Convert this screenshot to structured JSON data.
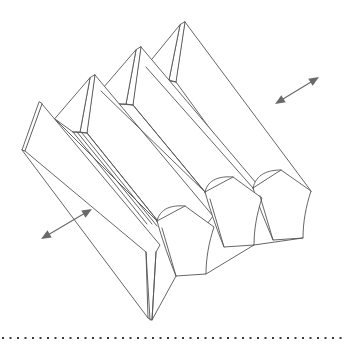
{
  "figure": {
    "background_color": "#ffffff",
    "line_color": "#555555",
    "arrow_color": "#6a6a6a",
    "rule_color": "#3a3a3a",
    "width": 347,
    "height": 357,
    "caption": ""
  },
  "annotations": {
    "arrow_upper_right": {
      "name": "expansion-direction-arrow-upper-right",
      "type": "double-headed-arrow",
      "start": [
        275,
        104
      ],
      "end": [
        319,
        77
      ],
      "label": ""
    },
    "arrow_lower_left": {
      "name": "expansion-direction-arrow-lower-left",
      "type": "double-headed-arrow",
      "start": [
        41,
        239
      ],
      "end": [
        92,
        209
      ],
      "label": ""
    }
  },
  "separator": {
    "name": "dotted-rule",
    "y": 338,
    "x_start": 2,
    "x_end": 345,
    "style": "dotted"
  },
  "geometry": {
    "ridge_count": 4,
    "ridge_apexes": [
      [
        185,
        22
      ],
      [
        141,
        47
      ],
      [
        95,
        75
      ],
      [
        42,
        104
      ]
    ],
    "end_flap_count": 3,
    "description": "Four parallel diagonal ridges forming a corrugated sheet, with curved end flaps at the lower-right ends and sharp creases at the upper-left peaks."
  }
}
